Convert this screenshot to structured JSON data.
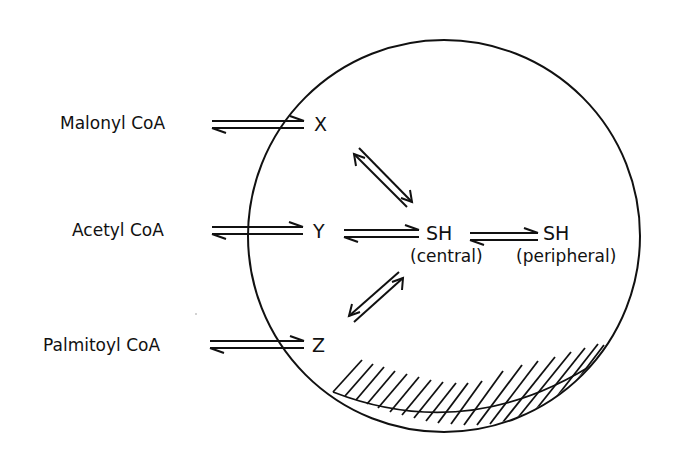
{
  "diagram": {
    "type": "fatty acid synthase compartment scheme",
    "colors": {
      "ink": "#111111",
      "background": "#ffffff"
    },
    "external_substrates": [
      {
        "id": "malonyl",
        "label": "Malonyl CoA",
        "binds_to": "X"
      },
      {
        "id": "acetyl",
        "label": "Acetyl CoA",
        "binds_to": "Y"
      },
      {
        "id": "palmitoyl",
        "label": "Palmitoyl CoA",
        "binds_to": "Z"
      }
    ],
    "sites": {
      "x": "X",
      "y": "Y",
      "z": "Z",
      "sh_central": "SH",
      "sh_central_caption": "(central)",
      "sh_peripheral": "SH",
      "sh_peripheral_caption": "(peripheral)"
    },
    "equilibria": [
      {
        "from": "Malonyl CoA",
        "to": "X",
        "type": "reversible"
      },
      {
        "from": "Acetyl CoA",
        "to": "Y",
        "type": "reversible"
      },
      {
        "from": "Palmitoyl CoA",
        "to": "Z",
        "type": "reversible"
      },
      {
        "from": "X",
        "to": "SH (central)",
        "type": "reversible"
      },
      {
        "from": "Y",
        "to": "SH (central)",
        "type": "reversible"
      },
      {
        "from": "Z",
        "to": "SH (central)",
        "type": "reversible"
      },
      {
        "from": "SH (central)",
        "to": "SH (peripheral)",
        "type": "reversible"
      }
    ],
    "enclosure": {
      "shape": "circle",
      "hatched_region": "bottom"
    }
  }
}
